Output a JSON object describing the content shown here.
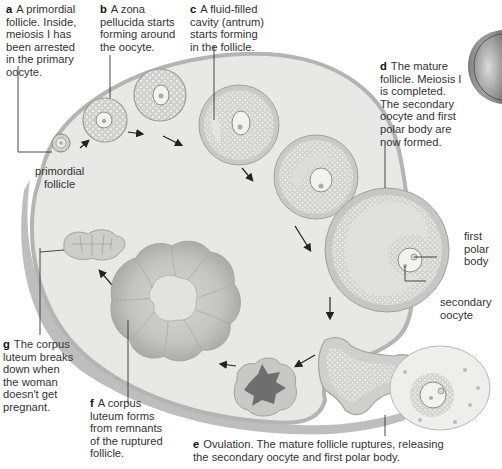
{
  "diagram": {
    "colors": {
      "ovary_fill": "#e9e9e8",
      "ovary_outline": "#b9b9b8",
      "ovary_shadow": "#9e9e9e",
      "follicle_outer": "#c8c8c6",
      "granulosa": "#dcdcda",
      "corpus_luteum": "#c4c4c2",
      "corpus_dark": "#6e6e6e",
      "arrow": "#222222",
      "text": "#333333"
    },
    "stages": {
      "a": {
        "letter": "a",
        "lines": [
          "A primordial",
          "follicle. Inside,",
          "meiosis I has",
          "been arrested",
          "in the primary",
          "oocyte."
        ]
      },
      "b": {
        "letter": "b",
        "lines": [
          "A zona",
          "pellucida starts",
          "forming around",
          "the oocyte."
        ]
      },
      "c": {
        "letter": "c",
        "lines": [
          "A fluid-filled",
          "cavity (antrum)",
          "starts forming",
          "in the follicle."
        ]
      },
      "d": {
        "letter": "d",
        "lines": [
          "The mature",
          "follicle. Meiosis I",
          "is completed.",
          "The secondary",
          "oocyte and first",
          "polar body are",
          "now formed."
        ]
      },
      "e": {
        "letter": "e",
        "lines": [
          "Ovulation. The mature follicle ruptures, releasing",
          "the secondary oocyte and first polar body."
        ]
      },
      "f": {
        "letter": "f",
        "lines": [
          "A corpus",
          "luteum forms",
          "from remnants",
          "of the ruptured",
          "follicle."
        ]
      },
      "g": {
        "letter": "g",
        "lines": [
          "The corpus",
          "luteum breaks",
          "down when",
          "the woman",
          "doesn't get",
          "pregnant."
        ]
      }
    },
    "structure_labels": {
      "primordial_follicle": [
        "primordial",
        "follicle"
      ],
      "first_polar_body": [
        "first",
        "polar",
        "body"
      ],
      "secondary_oocyte": [
        "secondary",
        "oocyte"
      ]
    }
  }
}
